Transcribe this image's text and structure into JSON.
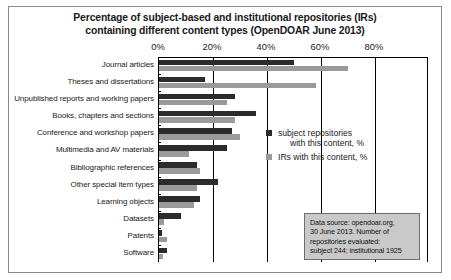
{
  "chart_data": {
    "type": "bar",
    "orientation": "horizontal",
    "title": "Percentage of subject-based and institutional repositories (IRs) containing different content types (OpenDOAR June 2013)",
    "title_line1": "Percentage of subject-based and institutional repositories (IRs)",
    "title_line2": "containing different content types (OpenDOAR June 2013)",
    "xlabel": "",
    "ylabel": "",
    "xlim": [
      0,
      90
    ],
    "xticks": [
      0,
      20,
      40,
      60,
      80
    ],
    "xtick_labels": [
      "0%",
      "20%",
      "40%",
      "60%",
      "80%"
    ],
    "grid": true,
    "legend_position": "center-right",
    "categories": [
      "Journal articles",
      "Theses and dissertations",
      "Unpublished reports and working papers",
      "Books, chapters and sections",
      "Conference and workshop papers",
      "Multimedia and AV materials",
      "Bibliographic references",
      "Other special item types",
      "Learning objects",
      "Datasets",
      "Patents",
      "Software"
    ],
    "series": [
      {
        "name": "subject repositories with this content, %",
        "color": "#2b2b2b",
        "values": [
          50,
          17,
          28,
          36,
          27,
          25,
          14,
          22,
          15,
          8,
          1,
          3
        ]
      },
      {
        "name": "IRs with this content, %",
        "color": "#9a9a9a",
        "values": [
          70,
          58,
          25,
          28,
          30,
          11,
          15,
          14,
          13,
          2,
          3,
          1.5
        ]
      }
    ],
    "annotations": [
      "Data source: opendoar.org, 30 June 2013. Number of repositories evaluated: subject 244; institutional 1925"
    ]
  },
  "legend": {
    "items": [
      {
        "label_line1": "subject repositories",
        "label_line2": "with this content, %"
      },
      {
        "label_line1": "IRs with this content, %",
        "label_line2": ""
      }
    ]
  },
  "source_note": {
    "line1": "Data source: opendoar.org,",
    "line2": "30 June 2013. Number of",
    "line3": "repositories evaluated:",
    "line4": "subject 244; institutional 1925"
  }
}
